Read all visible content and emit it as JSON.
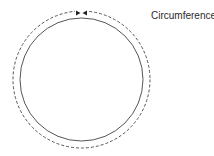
{
  "diagram": {
    "label": "Circumference",
    "circle": {
      "cx": 81.5,
      "cy": 79.5,
      "r": 61.5,
      "stroke": "#555555"
    },
    "circumference_path": {
      "cx": 81.5,
      "cy": 79.5,
      "r": 68.5,
      "stroke": "#555555",
      "dash": "3,2"
    },
    "arrows": {
      "color": "#222222",
      "position": "top"
    }
  }
}
